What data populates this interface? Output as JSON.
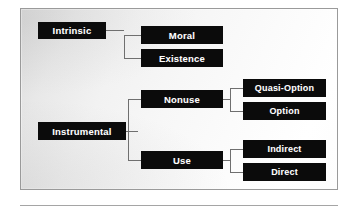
{
  "figure": {
    "style": {
      "node_fill": "#0b0b0b",
      "node_text": "#ffffff",
      "connector": "#6f6f6f",
      "frame_border": "#9a9a9a",
      "background_light": "#ffffff",
      "background_dark": "#d9d9d9"
    },
    "nodes": {
      "intrinsic": "Intrinsic",
      "moral": "Moral",
      "existence": "Existence",
      "instrumental": "Instrumental",
      "nonuse": "Nonuse",
      "use": "Use",
      "quasi_option": "Quasi-Option",
      "option": "Option",
      "indirect": "Indirect",
      "direct": "Direct"
    },
    "tree": [
      {
        "label": "Intrinsic",
        "children": [
          {
            "label": "Moral",
            "children": []
          },
          {
            "label": "Existence",
            "children": []
          }
        ]
      },
      {
        "label": "Instrumental",
        "children": [
          {
            "label": "Nonuse",
            "children": [
              {
                "label": "Quasi-Option",
                "children": []
              },
              {
                "label": "Option",
                "children": []
              }
            ]
          },
          {
            "label": "Use",
            "children": [
              {
                "label": "Indirect",
                "children": []
              },
              {
                "label": "Direct",
                "children": []
              }
            ]
          }
        ]
      }
    ]
  }
}
